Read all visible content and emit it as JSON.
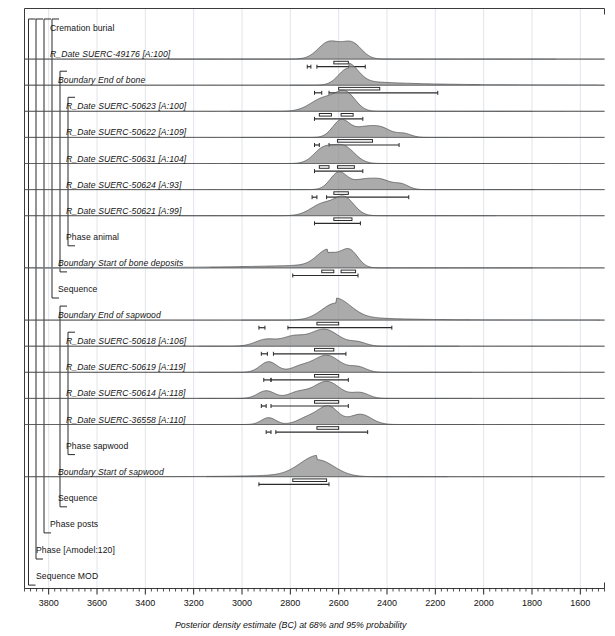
{
  "figure": {
    "axis_title": "Posterior density estimate (BC) at 68% and 95% probability",
    "frame_color": "#3a3a3a",
    "fill_color": "#8a8a8a",
    "line_color": "#4d4d4d",
    "grid_color": "#d8dde6"
  },
  "axis": {
    "label": "Posterior density estimate (BC) at 68% and 95% probability",
    "units": "BC",
    "x_min": 3900,
    "x_max": 1500,
    "direction": "decreasing",
    "major_step": 200,
    "minor_step": 25,
    "tick_labels": [
      "3800",
      "3600",
      "3400",
      "3200",
      "3000",
      "2800",
      "2600",
      "2400",
      "2200",
      "2000",
      "1800",
      "1600"
    ],
    "tick_values": [
      3800,
      3600,
      3400,
      3200,
      3000,
      2800,
      2600,
      2400,
      2200,
      2000,
      1800,
      1600
    ]
  },
  "rows": [
    {
      "label": "Cremation burial",
      "style": "plain",
      "indent": 1,
      "kind": "group"
    },
    {
      "label": "R_Date SUERC-49176 [A:100]",
      "style": "italic",
      "indent": 1,
      "kind": "date"
    },
    {
      "label": "Boundary End of bone",
      "style": "italic",
      "indent": 2,
      "kind": "boundary"
    },
    {
      "label": "R_Date SUERC-50623 [A:100]",
      "style": "italic",
      "indent": 3,
      "kind": "date"
    },
    {
      "label": "R_Date SUERC-50622 [A:109]",
      "style": "italic",
      "indent": 3,
      "kind": "date"
    },
    {
      "label": "R_Date SUERC-50631 [A:104]",
      "style": "italic",
      "indent": 3,
      "kind": "date"
    },
    {
      "label": "R_Date SUERC-50624 [A:93]",
      "style": "italic",
      "indent": 3,
      "kind": "date"
    },
    {
      "label": "R_Date SUERC-50621 [A:99]",
      "style": "italic",
      "indent": 3,
      "kind": "date"
    },
    {
      "label": "Phase animal",
      "style": "plain",
      "indent": 3,
      "kind": "group"
    },
    {
      "label": "Boundary Start of bone deposits",
      "style": "italic",
      "indent": 2,
      "kind": "boundary"
    },
    {
      "label": "Sequence",
      "style": "plain",
      "indent": 2,
      "kind": "group"
    },
    {
      "label": "Boundary End of sapwood",
      "style": "italic",
      "indent": 2,
      "kind": "boundary"
    },
    {
      "label": "R_Date SUERC-50618 [A:106]",
      "style": "italic",
      "indent": 3,
      "kind": "date"
    },
    {
      "label": "R_Date SUERC-50619 [A:119]",
      "style": "italic",
      "indent": 3,
      "kind": "date"
    },
    {
      "label": "R_Date SUERC-50614 [A:118]",
      "style": "italic",
      "indent": 3,
      "kind": "date"
    },
    {
      "label": "R_Date SUERC-36558 [A:110]",
      "style": "italic",
      "indent": 3,
      "kind": "date"
    },
    {
      "label": "Phase sapwood",
      "style": "plain",
      "indent": 3,
      "kind": "group"
    },
    {
      "label": "Boundary Start of sapwood",
      "style": "italic",
      "indent": 2,
      "kind": "boundary"
    },
    {
      "label": "Sequence",
      "style": "plain",
      "indent": 2,
      "kind": "group"
    },
    {
      "label": "Phase posts",
      "style": "plain",
      "indent": 1,
      "kind": "group"
    },
    {
      "label": "Phase [Amodel:120]",
      "style": "plain",
      "indent": 0,
      "kind": "group"
    },
    {
      "label": "Sequence MOD",
      "style": "plain",
      "indent": 0,
      "kind": "group"
    }
  ],
  "chart_data": {
    "type": "area",
    "title": "",
    "xlabel": "Posterior density estimate (BC) at 68% and 95% probability",
    "ylabel": "",
    "xlim": [
      3900,
      1500
    ],
    "grid": true,
    "series": [
      {
        "name": "R_Date SUERC-49176 [A:100]",
        "row": 1,
        "baseline": [
          3300,
          1700
        ],
        "peaks": [
          {
            "center": 2640,
            "half_width": 45,
            "height": 1.0
          },
          {
            "center": 2545,
            "half_width": 40,
            "height": 0.92
          }
        ],
        "range68": [
          [
            2620,
            2560
          ]
        ],
        "range95": [
          [
            2690,
            2490
          ],
          [
            2730,
            2715
          ]
        ]
      },
      {
        "name": "Boundary End of bone",
        "row": 2,
        "baseline": [
          2800,
          1530
        ],
        "peaks": [
          {
            "center": 2560,
            "half_width": 40,
            "height": 1.0,
            "tail_right": 560
          }
        ],
        "range68": [
          [
            2600,
            2430
          ]
        ],
        "range95": [
          [
            2640,
            2190
          ],
          [
            2700,
            2670
          ]
        ]
      },
      {
        "name": "R_Date SUERC-50623 [A:100]",
        "row": 3,
        "baseline": [
          3050,
          1800
        ],
        "peaks": [
          {
            "center": 2660,
            "half_width": 55,
            "height": 0.78
          },
          {
            "center": 2570,
            "half_width": 40,
            "height": 1.0
          }
        ],
        "range68": [
          [
            2680,
            2630
          ],
          [
            2590,
            2540
          ]
        ],
        "range95": [
          [
            2700,
            2500
          ]
        ]
      },
      {
        "name": "R_Date SUERC-50622 [A:109]",
        "row": 4,
        "baseline": [
          3000,
          1800
        ],
        "peaks": [
          {
            "center": 2590,
            "half_width": 35,
            "height": 1.0
          },
          {
            "center": 2495,
            "half_width": 45,
            "height": 0.55
          },
          {
            "center": 2420,
            "half_width": 40,
            "height": 0.48
          },
          {
            "center": 2330,
            "half_width": 30,
            "height": 0.22
          }
        ],
        "range68": [
          [
            2605,
            2460
          ]
        ],
        "range95": [
          [
            2640,
            2350
          ],
          [
            2700,
            2680
          ]
        ]
      },
      {
        "name": "R_Date SUERC-50631 [A:104]",
        "row": 5,
        "baseline": [
          3050,
          1820
        ],
        "peaks": [
          {
            "center": 2665,
            "half_width": 40,
            "height": 0.82
          },
          {
            "center": 2580,
            "half_width": 45,
            "height": 1.0
          }
        ],
        "range68": [
          [
            2680,
            2640
          ],
          [
            2605,
            2535
          ]
        ],
        "range95": [
          [
            2700,
            2500
          ]
        ]
      },
      {
        "name": "R_Date SUERC-50624 [A:93]",
        "row": 6,
        "baseline": [
          2980,
          1790
        ],
        "peaks": [
          {
            "center": 2600,
            "half_width": 35,
            "height": 1.0
          },
          {
            "center": 2500,
            "half_width": 45,
            "height": 0.55
          },
          {
            "center": 2420,
            "half_width": 40,
            "height": 0.5
          },
          {
            "center": 2340,
            "half_width": 30,
            "height": 0.3
          }
        ],
        "range68": [
          [
            2620,
            2560
          ]
        ],
        "range95": [
          [
            2650,
            2310
          ],
          [
            2710,
            2690
          ]
        ]
      },
      {
        "name": "R_Date SUERC-50621 [A:99]",
        "row": 7,
        "baseline": [
          3250,
          1950
        ],
        "peaks": [
          {
            "center": 2665,
            "half_width": 50,
            "height": 0.7
          },
          {
            "center": 2575,
            "half_width": 40,
            "height": 1.0
          }
        ],
        "range68": [
          [
            2620,
            2545
          ]
        ],
        "range95": [
          [
            2700,
            2510
          ]
        ]
      },
      {
        "name": "Boundary Start of bone deposits",
        "row": 9,
        "baseline": [
          3850,
          1800
        ],
        "peaks": [
          {
            "center": 2645,
            "half_width": 45,
            "height": 0.86,
            "tail_left": 800
          },
          {
            "center": 2555,
            "half_width": 35,
            "height": 1.0
          }
        ],
        "range68": [
          [
            2670,
            2620
          ],
          [
            2590,
            2530
          ]
        ],
        "range95": [
          [
            2790,
            2520
          ]
        ]
      },
      {
        "name": "Boundary End of sapwood",
        "row": 11,
        "baseline": [
          3000,
          1520
        ],
        "peaks": [
          {
            "center": 2610,
            "half_width": 60,
            "height": 1.0,
            "tail_right": 420
          }
        ],
        "range68": [
          [
            2690,
            2600
          ]
        ],
        "range95": [
          [
            2810,
            2380
          ],
          [
            2930,
            2905
          ]
        ]
      },
      {
        "name": "R_Date SUERC-50618 [A:106]",
        "row": 12,
        "baseline": [
          3180,
          2100
        ],
        "peaks": [
          {
            "center": 2900,
            "half_width": 45,
            "height": 0.4
          },
          {
            "center": 2790,
            "half_width": 45,
            "height": 0.52
          },
          {
            "center": 2660,
            "half_width": 60,
            "height": 1.0
          },
          {
            "center": 2520,
            "half_width": 35,
            "height": 0.22
          }
        ],
        "range68": [
          [
            2700,
            2620
          ]
        ],
        "range95": [
          [
            2870,
            2570
          ],
          [
            2920,
            2895
          ]
        ]
      },
      {
        "name": "R_Date SUERC-50619 [A:119]",
        "row": 13,
        "baseline": [
          3180,
          2050
        ],
        "peaks": [
          {
            "center": 2890,
            "half_width": 35,
            "height": 0.62
          },
          {
            "center": 2760,
            "half_width": 40,
            "height": 0.3
          },
          {
            "center": 2650,
            "half_width": 55,
            "height": 1.0
          },
          {
            "center": 2520,
            "half_width": 35,
            "height": 0.3
          }
        ],
        "range68": [
          [
            2700,
            2600
          ]
        ],
        "range95": [
          [
            2880,
            2560
          ],
          [
            2910,
            2880
          ]
        ]
      },
      {
        "name": "R_Date SUERC-50614 [A:118]",
        "row": 14,
        "baseline": [
          3180,
          2050
        ],
        "peaks": [
          {
            "center": 2900,
            "half_width": 35,
            "height": 0.45
          },
          {
            "center": 2770,
            "half_width": 40,
            "height": 0.34
          },
          {
            "center": 2650,
            "half_width": 55,
            "height": 1.0
          },
          {
            "center": 2510,
            "half_width": 35,
            "height": 0.32
          }
        ],
        "range68": [
          [
            2700,
            2600
          ]
        ],
        "range95": [
          [
            2880,
            2560
          ],
          [
            2920,
            2900
          ]
        ]
      },
      {
        "name": "R_Date SUERC-36558 [A:110]",
        "row": 15,
        "baseline": [
          3180,
          2030
        ],
        "peaks": [
          {
            "center": 2890,
            "half_width": 30,
            "height": 0.4
          },
          {
            "center": 2720,
            "half_width": 45,
            "height": 0.45
          },
          {
            "center": 2640,
            "half_width": 40,
            "height": 1.0
          },
          {
            "center": 2510,
            "half_width": 45,
            "height": 0.6
          }
        ],
        "range68": [
          [
            2690,
            2600
          ]
        ],
        "range95": [
          [
            2860,
            2480
          ],
          [
            2900,
            2880
          ]
        ]
      },
      {
        "name": "Boundary Start of sapwood",
        "row": 17,
        "baseline": [
          3150,
          2150
        ],
        "peaks": [
          {
            "center": 2690,
            "half_width": 70,
            "height": 1.0,
            "tail_left": 400
          }
        ],
        "range68": [
          [
            2790,
            2650
          ]
        ],
        "range95": [
          [
            2930,
            2640
          ]
        ]
      }
    ]
  }
}
